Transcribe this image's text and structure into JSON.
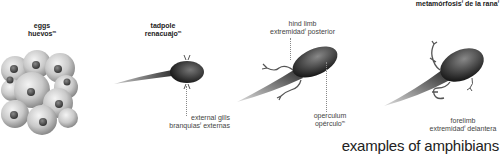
{
  "title": {
    "text": "metamórfosis",
    "sup1": "f",
    "rest": " de la rana",
    "sup2": "f"
  },
  "stages": [
    {
      "en": "eggs",
      "es": "huevos",
      "gender": "m"
    },
    {
      "en": "tadpole",
      "es": "renacuajo",
      "gender": "m"
    }
  ],
  "callouts": {
    "hind_limb": {
      "en": "hind limb",
      "es": "extremidad",
      "gender": "f",
      "es_rest": " posterior"
    },
    "external_gills": {
      "en": "external gills",
      "es": "branquias",
      "gender": "f",
      "es_rest": " externas"
    },
    "operculum": {
      "en": "operculum",
      "es": "opérculo",
      "gender": "m"
    },
    "forelimb": {
      "en": "forelimb",
      "es": "extremidad",
      "gender": "f",
      "es_rest": " delantera"
    }
  },
  "footer": "examples of amphibians",
  "colors": {
    "ink": "#222222",
    "label": "#444444",
    "background": "#ffffff"
  }
}
